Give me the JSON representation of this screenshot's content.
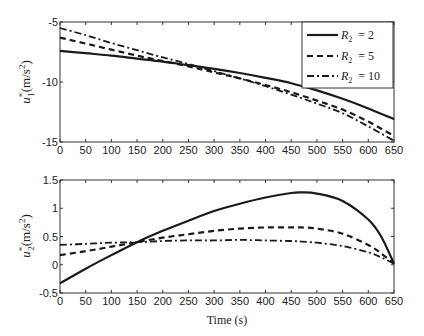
{
  "chart_data": [
    {
      "type": "line",
      "title": "",
      "xlabel": "",
      "ylabel": "u1*(m/s^2)",
      "ylabel_main": "u",
      "ylabel_sup": "*",
      "ylabel_sub": "1",
      "ylabel_unit": "(m/s",
      "ylabel_unit_sup": "2",
      "ylabel_close": ")",
      "xlim": [
        0,
        650
      ],
      "ylim": [
        -15,
        -5
      ],
      "xticks": [
        0,
        50,
        100,
        150,
        200,
        250,
        300,
        350,
        400,
        450,
        500,
        550,
        600,
        650
      ],
      "yticks": [
        -15,
        -10,
        -5
      ],
      "grid": false,
      "legend_position": "upper right",
      "x": [
        0,
        50,
        100,
        150,
        200,
        250,
        300,
        350,
        400,
        450,
        500,
        550,
        600,
        650
      ],
      "series": [
        {
          "name": "R2 = 2",
          "style": "solid",
          "values": [
            -7.4,
            -7.6,
            -7.8,
            -8.05,
            -8.3,
            -8.6,
            -8.9,
            -9.25,
            -9.65,
            -10.1,
            -10.7,
            -11.4,
            -12.2,
            -13.1
          ]
        },
        {
          "name": "R2 = 5",
          "style": "dashed",
          "values": [
            -6.3,
            -6.8,
            -7.3,
            -7.8,
            -8.25,
            -8.7,
            -9.2,
            -9.7,
            -10.25,
            -10.85,
            -11.55,
            -12.3,
            -13.3,
            -14.5
          ]
        },
        {
          "name": "R2 = 10",
          "style": "dashdot",
          "values": [
            -5.5,
            -6.1,
            -6.75,
            -7.35,
            -7.95,
            -8.5,
            -9.1,
            -9.7,
            -10.35,
            -11.05,
            -11.8,
            -12.6,
            -13.7,
            -14.9
          ]
        }
      ]
    },
    {
      "type": "line",
      "title": "",
      "xlabel": "Time (s)",
      "ylabel": "u2*(m/s^2)",
      "ylabel_main": "u",
      "ylabel_sup": "*",
      "ylabel_sub": "2",
      "ylabel_unit": "(m/s",
      "ylabel_unit_sup": "2",
      "ylabel_close": ")",
      "xlim": [
        0,
        650
      ],
      "ylim": [
        -0.5,
        1.5
      ],
      "xticks": [
        0,
        50,
        100,
        150,
        200,
        250,
        300,
        350,
        400,
        450,
        500,
        550,
        600,
        650
      ],
      "yticks": [
        -0.5,
        0,
        0.5,
        1,
        1.5
      ],
      "grid": false,
      "x": [
        0,
        50,
        100,
        150,
        200,
        250,
        300,
        350,
        400,
        450,
        470,
        500,
        550,
        600,
        625,
        650
      ],
      "series": [
        {
          "name": "R2 = 2",
          "style": "solid",
          "values": [
            -0.33,
            -0.07,
            0.17,
            0.4,
            0.6,
            0.78,
            0.95,
            1.08,
            1.19,
            1.27,
            1.28,
            1.26,
            1.13,
            0.8,
            0.5,
            0.02
          ]
        },
        {
          "name": "R2 = 5",
          "style": "dashed",
          "values": [
            0.17,
            0.24,
            0.32,
            0.4,
            0.48,
            0.54,
            0.6,
            0.64,
            0.66,
            0.66,
            0.66,
            0.64,
            0.55,
            0.35,
            0.2,
            0.02
          ]
        },
        {
          "name": "R2 = 10",
          "style": "dashdot",
          "values": [
            0.35,
            0.37,
            0.39,
            0.4,
            0.42,
            0.43,
            0.43,
            0.44,
            0.43,
            0.42,
            0.41,
            0.39,
            0.33,
            0.22,
            0.13,
            0.02
          ]
        }
      ]
    }
  ],
  "legend": {
    "items": [
      {
        "symbol": "R",
        "sub": "2",
        "value": "= 2",
        "style": "solid"
      },
      {
        "symbol": "R",
        "sub": "2",
        "value": "= 5",
        "style": "dashed"
      },
      {
        "symbol": "R",
        "sub": "2",
        "value": "= 10",
        "style": "dashdot"
      }
    ]
  },
  "colors": {
    "line": "#1a1a1a",
    "axis": "#333333",
    "background": "#ffffff"
  }
}
